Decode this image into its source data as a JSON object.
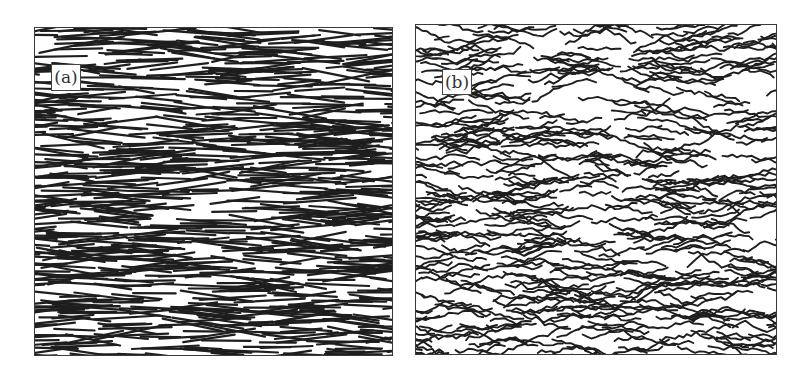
{
  "figure": {
    "panels": [
      {
        "id": "a",
        "label": "(a)",
        "description": "Straight rigid fibers, predominantly horizontally aligned",
        "fiber_type": "straight",
        "fiber_count": 900,
        "fiber_length_px": [
          35,
          75
        ],
        "angle_spread_deg": 14,
        "stroke_color": "#1e1e1e",
        "stroke_width": 2.2,
        "seed": 7
      },
      {
        "id": "b",
        "label": "(b)",
        "description": "Wavy flexible fibers, predominantly horizontally aligned",
        "fiber_type": "wavy",
        "fiber_count": 520,
        "fiber_length_px": [
          30,
          80
        ],
        "angle_spread_deg": 18,
        "stroke_color": "#1e1e1e",
        "stroke_width": 1.9,
        "seed": 13
      }
    ]
  }
}
